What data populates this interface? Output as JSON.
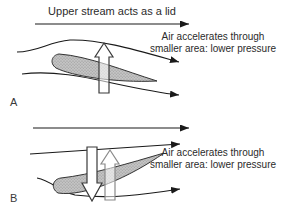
{
  "figure": {
    "panel_a": {
      "label": "A",
      "lid_caption": "Upper stream acts as a lid",
      "annotation": {
        "line1": "Air accelerates through",
        "line2": "smaller area: lower pressure"
      }
    },
    "panel_b": {
      "label": "B",
      "annotation": {
        "line1": "Air accelerates through",
        "line2": "smaller area: lower pressure"
      }
    },
    "colors": {
      "background": "#ffffff",
      "line": "#1a1a1a",
      "airfoil_fill": "#c4c4c4",
      "airfoil_dot": "#8a8a8a",
      "light_arrow_outline": "#8a8a8a"
    }
  }
}
